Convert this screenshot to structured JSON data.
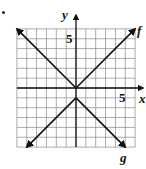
{
  "chart_data": {
    "type": "line",
    "title": "",
    "xlabel": "x",
    "ylabel": "y",
    "xlim": [
      -6,
      6
    ],
    "ylim": [
      -6,
      6
    ],
    "grid": true,
    "tick_labels": {
      "x": [
        "5"
      ],
      "y": [
        "5"
      ]
    },
    "series": [
      {
        "name": "f",
        "equation": "f(x) = |x|",
        "points": [
          [
            -6,
            6
          ],
          [
            0,
            0
          ],
          [
            6,
            6
          ]
        ]
      },
      {
        "name": "g",
        "equation": "g(x) = -|x| - 1",
        "points": [
          [
            -5,
            -6
          ],
          [
            0,
            -1
          ],
          [
            5,
            -6
          ]
        ]
      }
    ]
  },
  "labels": {
    "y_axis": "y",
    "x_axis": "x",
    "y_tick": "5",
    "x_tick": "5",
    "f": "f",
    "g": "g"
  }
}
